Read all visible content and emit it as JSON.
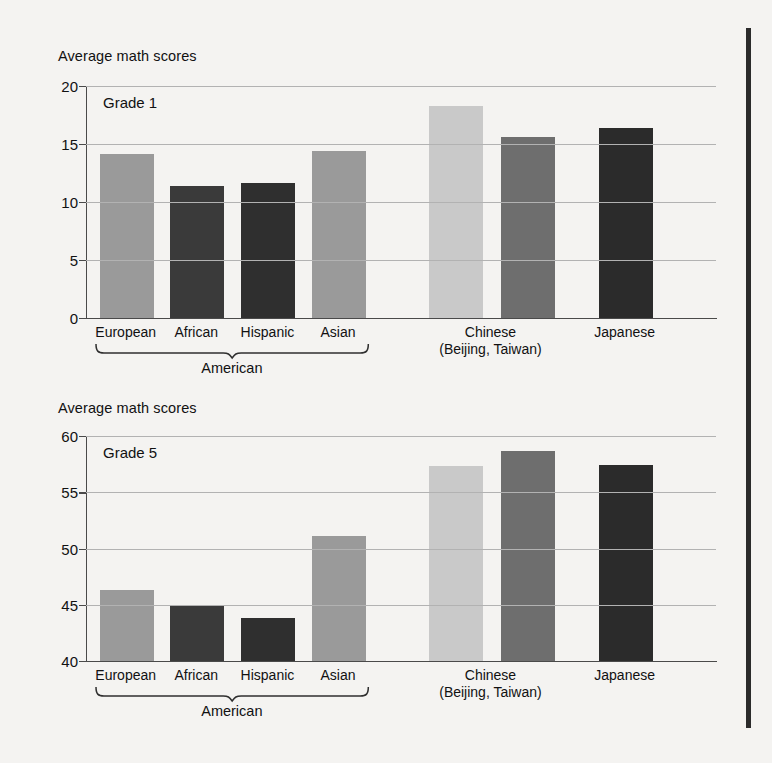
{
  "figure": {
    "background_color": "#f4f3f1",
    "page_edge_color": "#2b2b2b"
  },
  "colors": {
    "light_gray": "#c9c9c9",
    "medium_gray": "#9a9a9a",
    "mid_dark_gray": "#6e6e6e",
    "dark_gray": "#3a3a3a",
    "darkest_gray": "#2b2b2b",
    "gridline": "#b2b2b2",
    "axis": "#4a4a4a"
  },
  "chart_data": [
    {
      "type": "bar",
      "title": "Grade 1",
      "ylabel": "Average math scores",
      "xlabel": "",
      "ylim": [
        0,
        20
      ],
      "yticks": [
        0,
        5,
        10,
        15,
        20
      ],
      "ytick_labels": [
        "0",
        "5",
        "10",
        "15",
        "20"
      ],
      "grid": true,
      "legend": "none",
      "categories": [
        "European",
        "African",
        "Hispanic",
        "Asian",
        "Chinese",
        "Chinese",
        "Japanese"
      ],
      "values": [
        14.1,
        11.4,
        11.6,
        14.4,
        18.3,
        15.6,
        16.4
      ],
      "bar_colors": [
        "#9a9a9a",
        "#3a3a3a",
        "#2f2f2f",
        "#9a9a9a",
        "#c9c9c9",
        "#6e6e6e",
        "#2b2b2b"
      ],
      "group_brackets": [
        {
          "label": "American",
          "from": 0,
          "to": 3
        }
      ],
      "x_axis_captions": [
        {
          "lines": [
            "European"
          ]
        },
        {
          "lines": [
            "African"
          ]
        },
        {
          "lines": [
            "Hispanic"
          ]
        },
        {
          "lines": [
            "Asian"
          ]
        },
        {
          "lines": [
            "Chinese",
            "(Beijing, Taiwan)"
          ]
        },
        {
          "lines": [
            "Japanese"
          ]
        }
      ]
    },
    {
      "type": "bar",
      "title": "Grade 5",
      "ylabel": "Average math scores",
      "xlabel": "",
      "ylim": [
        40,
        60
      ],
      "yticks": [
        40,
        45,
        50,
        55,
        60
      ],
      "ytick_labels": [
        "40",
        "45",
        "50",
        "55",
        "60"
      ],
      "grid": true,
      "legend": "none",
      "categories": [
        "European",
        "African",
        "Hispanic",
        "Asian",
        "Chinese",
        "Chinese",
        "Japanese"
      ],
      "values": [
        46.3,
        44.9,
        43.8,
        51.1,
        57.3,
        58.7,
        57.4
      ],
      "bar_colors": [
        "#9a9a9a",
        "#3a3a3a",
        "#2f2f2f",
        "#9a9a9a",
        "#c9c9c9",
        "#6e6e6e",
        "#2b2b2b"
      ],
      "group_brackets": [
        {
          "label": "American",
          "from": 0,
          "to": 3
        }
      ],
      "x_axis_captions": [
        {
          "lines": [
            "European"
          ]
        },
        {
          "lines": [
            "African"
          ]
        },
        {
          "lines": [
            "Hispanic"
          ]
        },
        {
          "lines": [
            "Asian"
          ]
        },
        {
          "lines": [
            "Chinese",
            "(Beijing, Taiwan)"
          ]
        },
        {
          "lines": [
            "Japanese"
          ]
        }
      ]
    }
  ],
  "panels": [
    {
      "axis_title": "Average math scores",
      "grade_label": "Grade 1",
      "ytick_labels": [
        "20",
        "15",
        "10",
        "5",
        "0"
      ],
      "xlabels": [
        {
          "line1": "European",
          "line2": ""
        },
        {
          "line1": "African",
          "line2": ""
        },
        {
          "line1": "Hispanic",
          "line2": ""
        },
        {
          "line1": "Asian",
          "line2": ""
        },
        {
          "line1": "Chinese",
          "line2": "(Beijing, Taiwan)"
        },
        {
          "line1": "Japanese",
          "line2": ""
        }
      ],
      "bracket_label": "American"
    },
    {
      "axis_title": "Average math scores",
      "grade_label": "Grade 5",
      "ytick_labels": [
        "60",
        "55",
        "50",
        "45",
        "40"
      ],
      "xlabels": [
        {
          "line1": "European",
          "line2": ""
        },
        {
          "line1": "African",
          "line2": ""
        },
        {
          "line1": "Hispanic",
          "line2": ""
        },
        {
          "line1": "Asian",
          "line2": ""
        },
        {
          "line1": "Chinese",
          "line2": "(Beijing, Taiwan)"
        },
        {
          "line1": "Japanese",
          "line2": ""
        }
      ],
      "bracket_label": "American"
    }
  ]
}
